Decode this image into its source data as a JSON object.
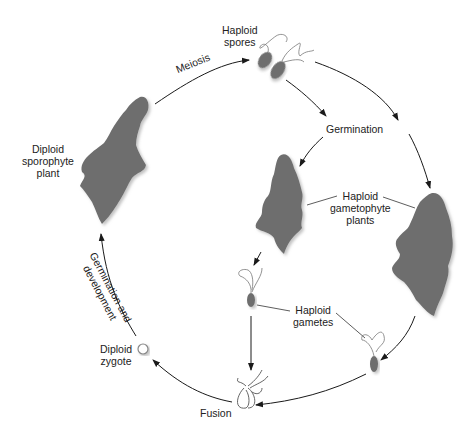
{
  "diagram": {
    "colors": {
      "plant_fill": "#6e6e6e",
      "plant_shadow": "#cfcfcf",
      "arrow": "#1a1a1a",
      "text": "#222222",
      "background": "#ffffff"
    },
    "nodes": {
      "haploid_spores": {
        "line1": "Haploid",
        "line2": "spores"
      },
      "germination": {
        "label": "Germination"
      },
      "haploid_gametophyte": {
        "line1": "Haploid",
        "line2": "gametophyte",
        "line3": "plants"
      },
      "haploid_gametes": {
        "line1": "Haploid",
        "line2": "gametes"
      },
      "fusion": {
        "label": "Fusion"
      },
      "diploid_zygote": {
        "line1": "Diploid",
        "line2": "zygote"
      },
      "diploid_sporophyte": {
        "line1": "Diploid",
        "line2": "sporophyte",
        "line3": "plant"
      }
    },
    "edges": {
      "meiosis": {
        "label": "Meiosis"
      },
      "germination_development": {
        "line1": "Germination and",
        "line2": "development"
      }
    }
  }
}
